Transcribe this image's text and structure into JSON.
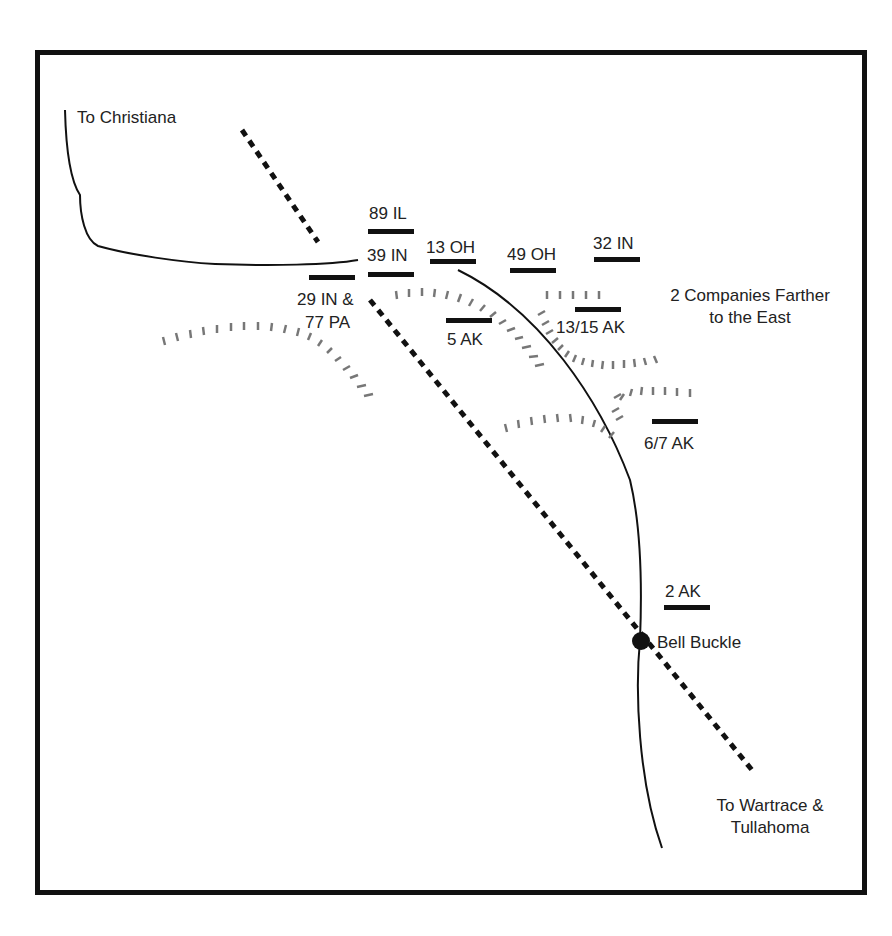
{
  "map": {
    "places": {
      "christiana": "To Christiana",
      "bell_buckle": "Bell Buckle",
      "wartrace_1": "To Wartrace &",
      "wartrace_2": "Tullahoma"
    },
    "note": {
      "line1": "2 Companies Farther",
      "line2": "to the East"
    },
    "units": [
      {
        "id": "89il",
        "label": "89 IL"
      },
      {
        "id": "39in",
        "label": "39 IN"
      },
      {
        "id": "13oh",
        "label": "13 OH"
      },
      {
        "id": "49oh",
        "label": "49 OH"
      },
      {
        "id": "32in",
        "label": "32 IN"
      },
      {
        "id": "29in",
        "label": "29 IN &"
      },
      {
        "id": "77pa",
        "label": "77 PA"
      },
      {
        "id": "5ak",
        "label": "5 AK"
      },
      {
        "id": "1315ak",
        "label": "13/15 AK"
      },
      {
        "id": "67ak",
        "label": "6/7 AK"
      },
      {
        "id": "2ak",
        "label": "2 AK"
      }
    ],
    "legend_colors": {
      "road": "#111111",
      "railroad": "#111111",
      "ridge": "#777777",
      "unit": "#111111"
    }
  }
}
